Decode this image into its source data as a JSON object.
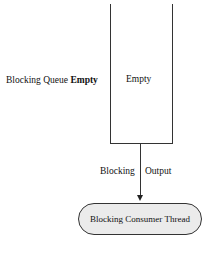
{
  "diagram": {
    "queue": {
      "label_prefix": "Blocking Queue ",
      "label_state": "Empty",
      "content": "Empty"
    },
    "arrow": {
      "left_label": "Blocking",
      "right_label": "Output"
    },
    "consumer": {
      "label": "Blocking Consumer Thread"
    },
    "colors": {
      "line": "#333333",
      "consumer_fill": "#ebebeb",
      "background": "#ffffff"
    }
  }
}
